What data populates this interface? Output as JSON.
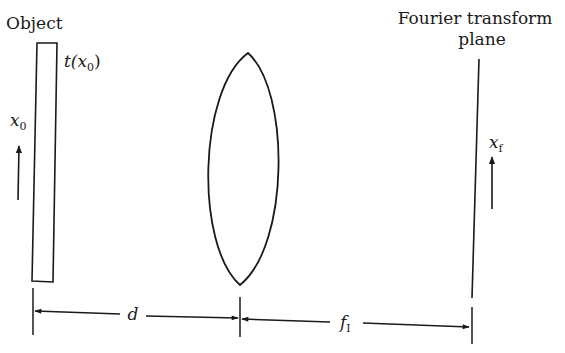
{
  "diagram": {
    "type": "optical-fourier-transform-setup",
    "labels": {
      "object": "Object",
      "transmittance_t": "t(",
      "transmittance_x": "x",
      "transmittance_sub": "0",
      "transmittance_close": ")",
      "x0_var": "x",
      "x0_sub": "0",
      "fourier_line1": "Fourier transform",
      "fourier_line2": "plane",
      "xf_var": "x",
      "xf_sub": "f",
      "distance_d": "d",
      "distance_f": "f",
      "distance_f_sub": "I"
    },
    "elements": [
      {
        "name": "object-plane",
        "shape": "rectangle"
      },
      {
        "name": "lens",
        "shape": "biconvex-lens"
      },
      {
        "name": "fourier-plane",
        "shape": "line"
      }
    ],
    "colors": {
      "stroke": "#1a1a1a",
      "background": "#ffffff"
    }
  }
}
